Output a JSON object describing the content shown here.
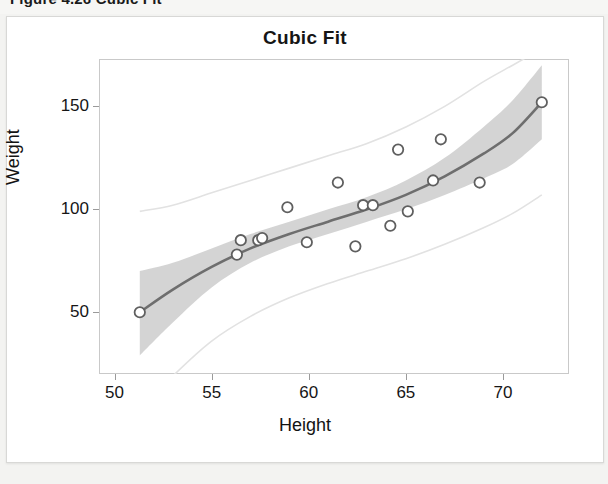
{
  "page": {
    "caption": "Figure 4.26    Cubic Fit"
  },
  "figure": {
    "title": "Cubic Fit"
  },
  "colors": {
    "fit_line": "#6e6e6e",
    "confidence_band": "#cccccc",
    "prediction_band": "#e2e2e2",
    "marker_stroke": "#5f5f5f",
    "marker_fill": "#ffffff",
    "frame": "#c9c9c9",
    "text": "#151515"
  },
  "chart_data": {
    "type": "scatter",
    "title": "Cubic Fit",
    "xlabel": "Height",
    "ylabel": "Weight",
    "xlim": [
      49.2,
      73.4
    ],
    "ylim": [
      20,
      173
    ],
    "grid": false,
    "legend": null,
    "xticks": [
      50,
      55,
      60,
      65,
      70
    ],
    "yticks": [
      50,
      100,
      150
    ],
    "series": [
      {
        "name": "Observations",
        "marker": "open-circle",
        "points": [
          {
            "x": 51.3,
            "y": 50
          },
          {
            "x": 56.3,
            "y": 78
          },
          {
            "x": 56.5,
            "y": 85
          },
          {
            "x": 57.4,
            "y": 85
          },
          {
            "x": 57.6,
            "y": 86
          },
          {
            "x": 58.9,
            "y": 101
          },
          {
            "x": 59.9,
            "y": 84
          },
          {
            "x": 61.5,
            "y": 113
          },
          {
            "x": 62.4,
            "y": 82
          },
          {
            "x": 62.8,
            "y": 102
          },
          {
            "x": 63.3,
            "y": 102
          },
          {
            "x": 64.2,
            "y": 92
          },
          {
            "x": 64.6,
            "y": 129
          },
          {
            "x": 65.1,
            "y": 99
          },
          {
            "x": 66.4,
            "y": 114
          },
          {
            "x": 66.8,
            "y": 134
          },
          {
            "x": 68.8,
            "y": 113
          },
          {
            "x": 72.0,
            "y": 152
          }
        ]
      }
    ],
    "fit": {
      "name": "Cubic fit",
      "degree": 3,
      "points": [
        {
          "x": 51.3,
          "y": 50
        },
        {
          "x": 53.0,
          "y": 61
        },
        {
          "x": 55.0,
          "y": 72
        },
        {
          "x": 57.0,
          "y": 81
        },
        {
          "x": 59.0,
          "y": 88
        },
        {
          "x": 61.0,
          "y": 94
        },
        {
          "x": 63.0,
          "y": 100
        },
        {
          "x": 65.0,
          "y": 107
        },
        {
          "x": 67.0,
          "y": 116
        },
        {
          "x": 69.0,
          "y": 127
        },
        {
          "x": 70.5,
          "y": 137
        },
        {
          "x": 72.0,
          "y": 152
        }
      ]
    },
    "confidence_band": {
      "name": "95% confidence band",
      "upper": [
        {
          "x": 51.3,
          "y": 70
        },
        {
          "x": 53.0,
          "y": 74
        },
        {
          "x": 55.0,
          "y": 81
        },
        {
          "x": 57.0,
          "y": 88
        },
        {
          "x": 59.0,
          "y": 94
        },
        {
          "x": 61.0,
          "y": 100
        },
        {
          "x": 63.0,
          "y": 106
        },
        {
          "x": 65.0,
          "y": 114
        },
        {
          "x": 67.0,
          "y": 125
        },
        {
          "x": 69.0,
          "y": 140
        },
        {
          "x": 70.5,
          "y": 153
        },
        {
          "x": 72.0,
          "y": 170
        }
      ],
      "lower": [
        {
          "x": 51.3,
          "y": 29
        },
        {
          "x": 53.0,
          "y": 45
        },
        {
          "x": 55.0,
          "y": 62
        },
        {
          "x": 57.0,
          "y": 74
        },
        {
          "x": 59.0,
          "y": 82
        },
        {
          "x": 61.0,
          "y": 88
        },
        {
          "x": 63.0,
          "y": 94
        },
        {
          "x": 65.0,
          "y": 100
        },
        {
          "x": 67.0,
          "y": 107
        },
        {
          "x": 69.0,
          "y": 115
        },
        {
          "x": 70.5,
          "y": 122
        },
        {
          "x": 72.0,
          "y": 134
        }
      ]
    },
    "prediction_band": {
      "name": "95% prediction band",
      "upper": [
        {
          "x": 51.3,
          "y": 99
        },
        {
          "x": 53.0,
          "y": 102
        },
        {
          "x": 55.0,
          "y": 108
        },
        {
          "x": 57.0,
          "y": 114
        },
        {
          "x": 59.0,
          "y": 120
        },
        {
          "x": 61.0,
          "y": 126
        },
        {
          "x": 63.0,
          "y": 132
        },
        {
          "x": 65.0,
          "y": 140
        },
        {
          "x": 67.0,
          "y": 150
        },
        {
          "x": 69.0,
          "y": 162
        },
        {
          "x": 70.5,
          "y": 170
        },
        {
          "x": 72.0,
          "y": 178
        }
      ],
      "lower": [
        {
          "x": 51.3,
          "y": 2
        },
        {
          "x": 53.0,
          "y": 19
        },
        {
          "x": 55.0,
          "y": 36
        },
        {
          "x": 57.0,
          "y": 48
        },
        {
          "x": 59.0,
          "y": 57
        },
        {
          "x": 61.0,
          "y": 64
        },
        {
          "x": 63.0,
          "y": 70
        },
        {
          "x": 65.0,
          "y": 76
        },
        {
          "x": 67.0,
          "y": 83
        },
        {
          "x": 69.0,
          "y": 91
        },
        {
          "x": 70.5,
          "y": 98
        },
        {
          "x": 72.0,
          "y": 107
        }
      ]
    }
  }
}
